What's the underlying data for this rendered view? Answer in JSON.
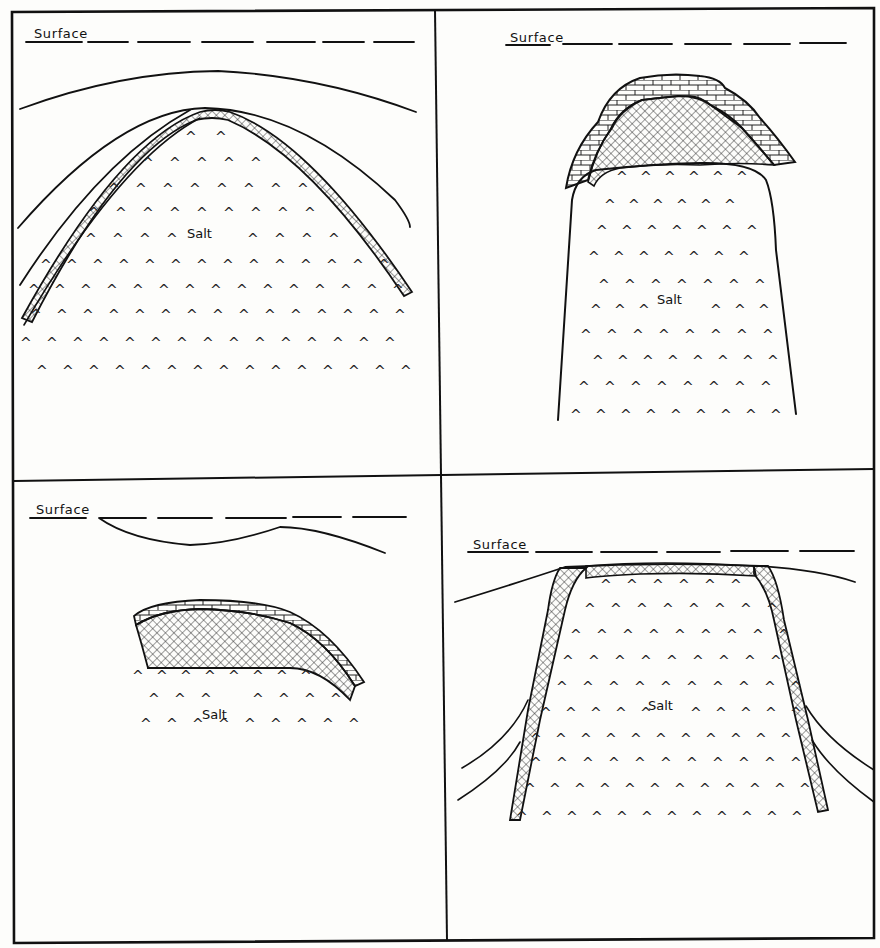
{
  "figure": {
    "panels": [
      {
        "id": "top-left",
        "surface_label": "Surface",
        "salt_label": "Salt",
        "features": [
          "dashed surface line",
          "broad anticlinal arch",
          "thin cross-hatched cap rock layer",
          "deep-seated salt body"
        ]
      },
      {
        "id": "top-right",
        "surface_label": "Surface",
        "salt_label": "Salt",
        "features": [
          "dashed surface line",
          "limestone (brick pattern) cap",
          "anhydrite (cross-hatched) cap",
          "tall salt stock"
        ]
      },
      {
        "id": "bottom-left",
        "surface_label": "Surface",
        "salt_label": "Salt",
        "features": [
          "dashed surface line",
          "wavy ground line",
          "tilted cap rock (brick + cross-hatch)",
          "truncated salt"
        ]
      },
      {
        "id": "bottom-right",
        "surface_label": "Surface",
        "salt_label": "Salt",
        "features": [
          "dashed surface line",
          "shallow flat-topped salt plug",
          "thin cap rock sheath",
          "upturned flanking beds"
        ]
      }
    ]
  },
  "colors": {
    "ink": "#111111",
    "paper": "#fdfdfb"
  }
}
